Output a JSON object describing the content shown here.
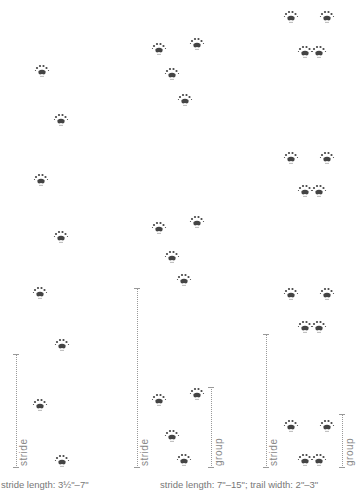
{
  "diagram": {
    "type": "animal track patterns",
    "columns": [
      {
        "id": "walk",
        "scale_labels": [
          "stride"
        ],
        "caption": "stride length: 3½\"–7\""
      },
      {
        "id": "bound",
        "scale_labels": [
          "stride",
          "group"
        ],
        "caption": "stride length: 7\"–15\"; trail width: 2\"–3\""
      },
      {
        "id": "lope",
        "scale_labels": [
          "stride",
          "group"
        ],
        "caption": ""
      }
    ],
    "labels": {
      "stride": "stride",
      "group": "group"
    },
    "captions": {
      "left": "stride length: 3½\"–7\"",
      "right": "stride length: 7\"–15\"; trail width: 2\"–3\""
    },
    "colors": {
      "print": "#444444",
      "scale": "#999999",
      "caption": "#777777"
    }
  }
}
